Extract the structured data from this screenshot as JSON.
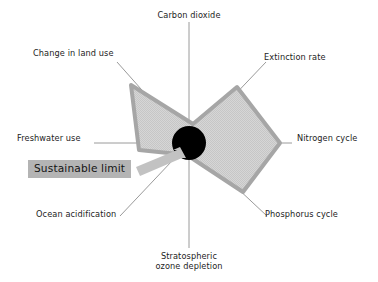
{
  "figure": {
    "title": "",
    "annotation": {
      "sustainable_limit_label": "Sustainable limit",
      "background_color": "#b4b4b4",
      "arrow_color": "#bfbfbf",
      "arrow_from": [
        138,
        168
      ],
      "arrow_to": [
        180,
        150
      ]
    },
    "colors": {
      "axis_line": "#9a9a9a",
      "polygon_fill": "#d0d0d0",
      "polygon_stroke": "#a6a6a6",
      "limit_circle": "#000000",
      "background": "#ffffff",
      "text": "#1d1d1d"
    },
    "center": [
      189,
      143
    ],
    "limit_circle_radius_px": 17,
    "axis_length_px": 130
  },
  "chart_data": {
    "type": "radar",
    "title": "",
    "subtitle": "",
    "xlabel": "",
    "ylabel": "",
    "grid": false,
    "legend": {
      "position": "inline-annotation",
      "entries": [
        {
          "label": "Sustainable limit",
          "color": "#000000",
          "shape": "circle"
        },
        {
          "label": "Current state",
          "color": "#d0d0d0",
          "shape": "polygon"
        }
      ]
    },
    "categories": [
      "Carbon dioxide",
      "Extinction rate",
      "Nitrogen cycle",
      "Phosphorus cycle",
      "Stratospheric ozone depletion",
      "Ocean acidification",
      "Freshwater use",
      "Change in land use"
    ],
    "axis_angles_deg": [
      90,
      45,
      0,
      -45,
      -90,
      -135,
      180,
      135
    ],
    "axis_label_positions": [
      "top",
      "top-right",
      "right",
      "bottom-right",
      "bottom",
      "bottom-left",
      "left",
      "top-left"
    ],
    "rlim": [
      0,
      130
    ],
    "series": [
      {
        "name": "Sustainable limit",
        "color": "#000000",
        "values": [
          17,
          17,
          17,
          17,
          17,
          17,
          17,
          17
        ]
      },
      {
        "name": "Current state",
        "color": "#d0d0d0",
        "values": [
          19,
          77,
          91,
          70,
          14,
          16,
          50,
          85
        ]
      }
    ],
    "vertex_pixel_coords": {
      "Carbon dioxide": [
        193,
        124
      ],
      "Extinction rate": [
        237,
        87
      ],
      "Nitrogen cycle": [
        280,
        143
      ],
      "Phosphorus cycle": [
        243,
        192
      ],
      "Stratospheric ozone depletion": [
        190,
        157
      ],
      "Ocean acidification": [
        178,
        154
      ],
      "Freshwater use": [
        139,
        150
      ],
      "Change in land use": [
        131,
        85
      ]
    }
  },
  "labels": {
    "carbon_dioxide": "Carbon dioxide",
    "change_in_land_use": "Change in land use",
    "extinction_rate": "Extinction rate",
    "freshwater_use": "Freshwater use",
    "nitrogen_cycle": "Nitrogen cycle",
    "ocean_acidification": "Ocean acidification",
    "phosphorus_cycle": "Phosphorus cycle",
    "stratospheric_ozone_depletion_line1": "Stratospheric",
    "stratospheric_ozone_depletion_line2": "ozone depletion"
  }
}
